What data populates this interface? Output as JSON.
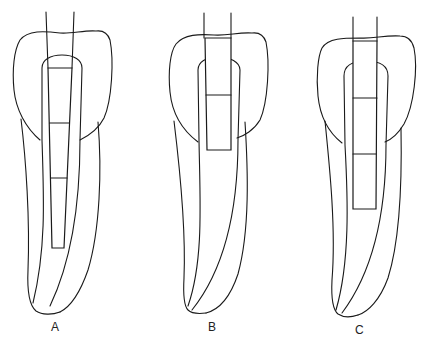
{
  "figure": {
    "line_color": "#1a1a1a",
    "background": "#ffffff",
    "panels": [
      {
        "label": "A",
        "post_segments": 3,
        "post_extent": "long, to apical third"
      },
      {
        "label": "B",
        "post_segments": 2,
        "post_extent": "short, within crown"
      },
      {
        "label": "C",
        "post_segments": 3,
        "post_extent": "medium, to mid-root"
      }
    ]
  }
}
